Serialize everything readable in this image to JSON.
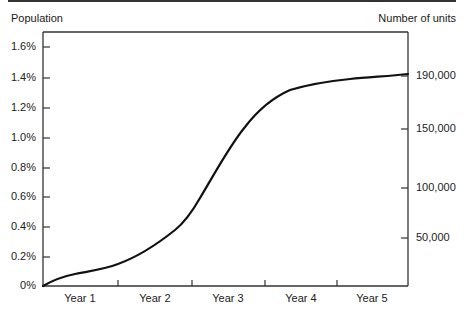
{
  "chart_data": {
    "type": "line",
    "title": "",
    "xlabel": "",
    "ylabel": "Population",
    "ylabel_right": "Number of units",
    "categories": [
      "Year 1",
      "Year 2",
      "Year 3",
      "Year 4",
      "Year 5"
    ],
    "x_ticks_years": [
      0,
      1,
      2,
      3,
      4,
      5
    ],
    "y_ticks_left": [
      "0%",
      "0.2%",
      "0.4%",
      "0.6%",
      "0.8%",
      "1.0%",
      "1.2%",
      "1.4%",
      "1.6%"
    ],
    "y_ticks_right": [
      "50,000",
      "100,000",
      "150,000",
      "190,000"
    ],
    "ylim": [
      0,
      1.7
    ],
    "grid": false,
    "legend": "none",
    "series": [
      {
        "name": "Population penetration (%)",
        "x": [
          0,
          0.5,
          1,
          1.5,
          2,
          2.5,
          3,
          3.5,
          4,
          4.5,
          5
        ],
        "values": [
          0,
          0.09,
          0.14,
          0.3,
          0.52,
          0.88,
          1.22,
          1.32,
          1.35,
          1.39,
          1.42
        ]
      }
    ]
  },
  "labels": {
    "left_title": "Population",
    "right_title": "Number of units",
    "left_ticks": [
      {
        "text": "1.6%",
        "y": 47
      },
      {
        "text": "1.4%",
        "y": 78
      },
      {
        "text": "1.2%",
        "y": 108
      },
      {
        "text": "1.0%",
        "y": 138
      },
      {
        "text": "0.8%",
        "y": 168
      },
      {
        "text": "0.6%",
        "y": 197
      },
      {
        "text": "0.4%",
        "y": 227
      },
      {
        "text": "0.2%",
        "y": 257
      },
      {
        "text": "0%",
        "y": 286
      }
    ],
    "right_ticks": [
      {
        "text": "190,000",
        "y": 76
      },
      {
        "text": "150,000",
        "y": 129
      },
      {
        "text": "100,000",
        "y": 188
      },
      {
        "text": "50,000",
        "y": 238
      }
    ],
    "x_ticks": [
      {
        "text": "Year 1",
        "x": 80
      },
      {
        "text": "Year 2",
        "x": 155
      },
      {
        "text": "Year 3",
        "x": 228
      },
      {
        "text": "Year 4",
        "x": 301
      },
      {
        "text": "Year 5",
        "x": 372
      }
    ]
  }
}
